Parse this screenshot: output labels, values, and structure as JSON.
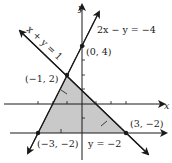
{
  "diagram": {
    "axes": {
      "x_label": "x",
      "y_label": "y",
      "origin_px": [
        82,
        104
      ],
      "unit_px": 14.5
    },
    "lines": [
      {
        "label": "2x − y = −4",
        "name": "line-2x-minus-y"
      },
      {
        "label": "x + y = 1",
        "name": "line-x-plus-y"
      },
      {
        "label": "y = −2",
        "name": "line-y-eq-minus-2"
      }
    ],
    "vertices": [
      {
        "label": "(0, 4)"
      },
      {
        "label": "(−1, 2)"
      },
      {
        "label": "(3, −2)"
      },
      {
        "label": "(−3, −2)"
      }
    ],
    "colors": {
      "shade": "#c9c9c9",
      "ink": "#1a1a1a"
    }
  }
}
